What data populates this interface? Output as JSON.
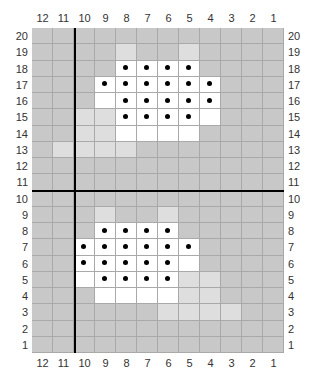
{
  "columns": [
    "12",
    "11",
    "10",
    "9",
    "8",
    "7",
    "6",
    "5",
    "4",
    "3",
    "2",
    "1"
  ],
  "rows": [
    "20",
    "19",
    "18",
    "17",
    "16",
    "15",
    "14",
    "13",
    "12",
    "11",
    "10",
    "9",
    "8",
    "7",
    "6",
    "5",
    "4",
    "3",
    "2",
    "1"
  ],
  "colors": {
    "gray": "#c8c8c8",
    "light": "#dedede",
    "white": "#ffffff",
    "dot": "#000000",
    "gridline": "#a9a9a9"
  },
  "cells": {
    "20": {},
    "19": {
      "8": "light",
      "5": "light"
    },
    "18": {
      "8": "dot",
      "7": "dot",
      "6": "dot",
      "5": "dot"
    },
    "17": {
      "9": "dot",
      "8": "dot",
      "7": "dot",
      "6": "dot",
      "5": "dot",
      "4": "dot"
    },
    "16": {
      "9": "white",
      "8": "dot",
      "7": "dot",
      "6": "dot",
      "5": "dot",
      "4": "dot"
    },
    "15": {
      "10": "light",
      "9": "light",
      "8": "dot",
      "7": "dot",
      "6": "dot",
      "5": "dot",
      "4": "white"
    },
    "14": {
      "10": "light",
      "9": "light",
      "8": "white",
      "7": "white",
      "6": "white",
      "5": "white"
    },
    "13": {
      "11": "light",
      "10": "light",
      "9": "light",
      "8": "light"
    },
    "12": {},
    "11": {},
    "10": {},
    "9": {
      "9": "light",
      "6": "light"
    },
    "8": {
      "9": "dot",
      "8": "dot",
      "7": "dot",
      "6": "dot"
    },
    "7": {
      "10": "dot",
      "9": "dot",
      "8": "dot",
      "7": "dot",
      "6": "dot",
      "5": "dot"
    },
    "6": {
      "10": "dot",
      "9": "dot",
      "8": "dot",
      "7": "dot",
      "6": "dot",
      "5": "white"
    },
    "5": {
      "10": "white",
      "9": "dot",
      "8": "dot",
      "7": "dot",
      "6": "dot",
      "5": "light",
      "4": "light"
    },
    "4": {
      "9": "white",
      "8": "white",
      "7": "white",
      "6": "white",
      "5": "light",
      "4": "light"
    },
    "3": {
      "6": "light",
      "5": "light",
      "4": "light",
      "3": "light"
    },
    "2": {},
    "1": {}
  },
  "dividers": {
    "vertical_after_column": "11",
    "horizontal_after_row": "11"
  }
}
